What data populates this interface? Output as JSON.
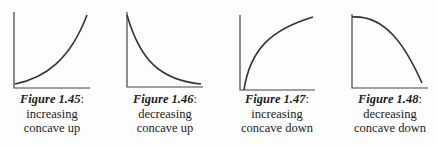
{
  "figures": [
    {
      "label": "Figure 1.45",
      "suffix": ":",
      "line1": "increasing",
      "line2": "concave up",
      "shape": "increasing-concave-up",
      "axes": {
        "x0": 14,
        "y0": 88,
        "top": 12,
        "right": 90
      },
      "curve": "M15,84 C45,78 70,60 87,15"
    },
    {
      "label": "Figure 1.46",
      "suffix": ":",
      "line1": "decreasing",
      "line2": "concave up",
      "shape": "decreasing-concave-up",
      "axes": {
        "x0": 127,
        "y0": 87,
        "top": 12,
        "right": 203
      },
      "curve": "M127,15 C140,60 160,80 201,84"
    },
    {
      "label": "Figure 1.47",
      "suffix": ":",
      "line1": "increasing",
      "line2": "concave down",
      "shape": "increasing-concave-down",
      "axes": {
        "x0": 240,
        "y0": 90,
        "top": 15,
        "right": 315
      },
      "curve": "M244,90 C250,50 270,30 313,17"
    },
    {
      "label": "Figure 1.48",
      "suffix": ":",
      "line1": "decreasing",
      "line2": "concave down",
      "shape": "decreasing-concave-down",
      "axes": {
        "x0": 352,
        "y0": 88,
        "top": 14,
        "right": 428
      },
      "curve": "M352,17 C385,15 405,45 422,83"
    }
  ],
  "colors": {
    "stroke": "#333333",
    "text": "#222222"
  }
}
